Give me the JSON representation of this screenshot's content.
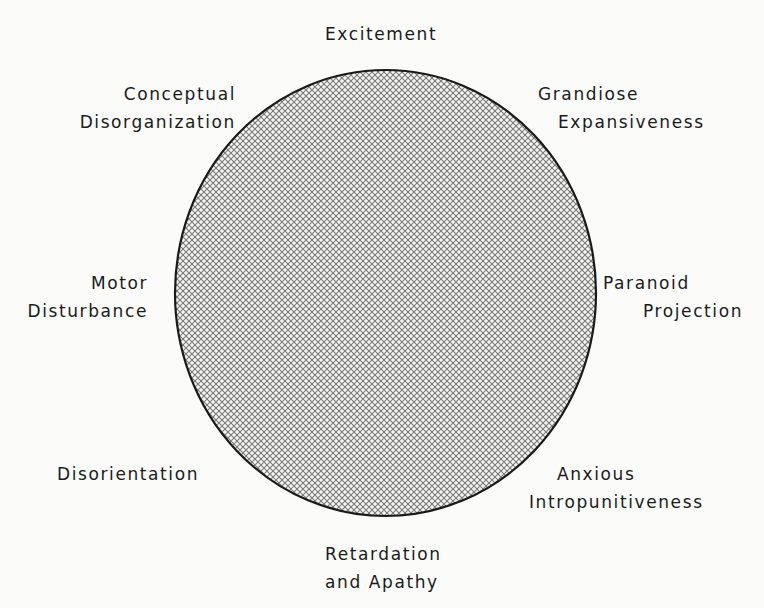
{
  "diagram": {
    "type": "circumplex",
    "shape": "circle",
    "fill_pattern": "crosshatch",
    "colors": {
      "background": "#fbfbfa",
      "outline": "#1a1a1a",
      "hatch": "#7a7a7a",
      "text": "#1a1a1a"
    },
    "labels": {
      "top": {
        "lines": [
          "Excitement"
        ]
      },
      "top_left": {
        "lines": [
          "Conceptual",
          "Disorganization"
        ]
      },
      "top_right": {
        "lines": [
          "Grandiose",
          "Expansiveness"
        ]
      },
      "left": {
        "lines": [
          "Motor",
          "Disturbance"
        ]
      },
      "right": {
        "lines": [
          "Paranoid",
          "Projection"
        ]
      },
      "bottom_left": {
        "lines": [
          "Disorientation"
        ]
      },
      "bottom_right": {
        "lines": [
          "Anxious",
          "Intropunitiveness"
        ]
      },
      "bottom": {
        "lines": [
          "Retardation",
          "and Apathy"
        ]
      }
    }
  }
}
